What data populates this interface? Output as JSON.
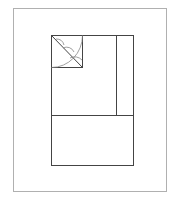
{
  "diagram": {
    "type": "floor-plan-layout",
    "colors": {
      "background": "#ffffff",
      "outer_frame": "#b0b0b0",
      "lines": "#444444",
      "arcs": "#888888"
    },
    "outer_frame": {
      "x": 13,
      "y": 8,
      "w": 153,
      "h": 183
    },
    "main_rect": {
      "x": 51,
      "y": 35,
      "w": 82,
      "h": 130
    },
    "vertical_divider_x": 116,
    "horizontal_divider_y": 115,
    "corner_square": {
      "x": 51,
      "y": 35,
      "w": 31,
      "h": 32
    }
  }
}
